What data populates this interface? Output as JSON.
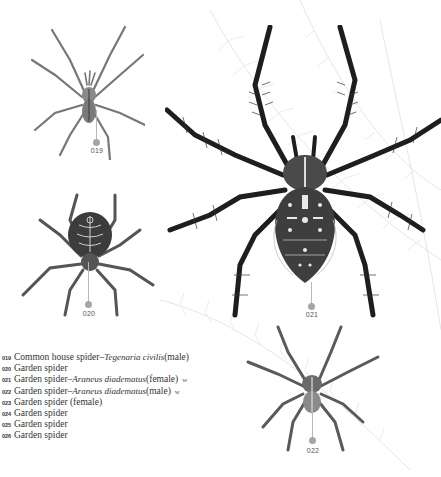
{
  "plate": {
    "figures": [
      {
        "id": "019",
        "label": "019"
      },
      {
        "id": "020",
        "label": "020"
      },
      {
        "id": "021",
        "label": "021"
      },
      {
        "id": "022",
        "label": "022"
      }
    ],
    "legend": [
      {
        "num": "019",
        "common": "Common house spider",
        "sep": " – ",
        "scientific": "Tegenaria civilis",
        "note": " (male)",
        "badge": ""
      },
      {
        "num": "020",
        "common": "Garden spider",
        "sep": "",
        "scientific": "",
        "note": "",
        "badge": ""
      },
      {
        "num": "021",
        "common": "Garden spider",
        "sep": " – ",
        "scientific": "Araneus diadematus",
        "note": " (female)",
        "badge": "w"
      },
      {
        "num": "022",
        "common": "Garden spider",
        "sep": " – ",
        "scientific": "Araneus diadematus",
        "note": " (male)",
        "badge": "w"
      },
      {
        "num": "023",
        "common": "Garden spider (female)",
        "sep": "",
        "scientific": "",
        "note": "",
        "badge": ""
      },
      {
        "num": "024",
        "common": "Garden spider",
        "sep": "",
        "scientific": "",
        "note": "",
        "badge": ""
      },
      {
        "num": "025",
        "common": "Garden spider",
        "sep": "",
        "scientific": "",
        "note": "",
        "badge": ""
      },
      {
        "num": "026",
        "common": "Garden spider",
        "sep": "",
        "scientific": "",
        "note": "",
        "badge": ""
      }
    ]
  },
  "colors": {
    "ink": "#2a2a2a",
    "marker": "#a5a5a5",
    "fern": "#e4e4e4"
  }
}
